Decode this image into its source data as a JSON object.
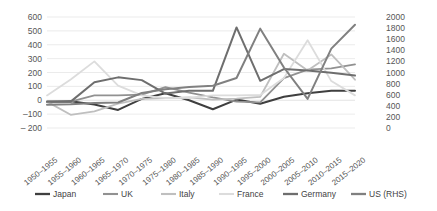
{
  "chart_data": {
    "type": "line",
    "title": "",
    "subtitle": "",
    "xlabel": "",
    "ylabel": "",
    "grid": true,
    "legend_position": "bottom",
    "categories": [
      "1950–1955",
      "1955–1960",
      "1960–1965",
      "1965–1970",
      "1970–1975",
      "1975–1980",
      "1980–1985",
      "1985–1990",
      "1990–1995",
      "1995–2000",
      "2000–2005",
      "2005–2010",
      "2010–2015",
      "2015–2020"
    ],
    "left_axis": {
      "label": "",
      "ylim": [
        -200,
        600
      ],
      "tick_step": 100,
      "ticks": [
        "600",
        "500",
        "400",
        "300",
        "200",
        "100",
        "0",
        "–100",
        "– 200"
      ],
      "tick_values": [
        600,
        500,
        400,
        300,
        200,
        100,
        0,
        -100,
        -200
      ]
    },
    "right_axis": {
      "label": "",
      "ylim": [
        0,
        2000
      ],
      "tick_step": 200,
      "ticks": [
        "2000",
        "1800",
        "1600",
        "1400",
        "1200",
        "1000",
        "800",
        "600",
        "400",
        "200",
        "0"
      ],
      "tick_values": [
        2000,
        1800,
        1600,
        1400,
        1200,
        1000,
        800,
        600,
        400,
        200,
        0
      ]
    },
    "series": [
      {
        "name": "Japan",
        "axis": "left",
        "color": "#3f3f3f",
        "width": 2.0,
        "values": [
          -10,
          -8,
          -30,
          -70,
          10,
          50,
          0,
          -65,
          5,
          -25,
          25,
          50,
          68,
          68
        ]
      },
      {
        "name": "UK",
        "axis": "left",
        "color": "#919191",
        "width": 1.8,
        "values": [
          -8,
          -10,
          35,
          35,
          40,
          95,
          55,
          20,
          -10,
          -15,
          160,
          220,
          230,
          258
        ]
      },
      {
        "name": "Italy",
        "axis": "left",
        "color": "#bfbfbf",
        "width": 1.8,
        "values": [
          -10,
          -105,
          -80,
          -25,
          10,
          15,
          20,
          5,
          12,
          25,
          335,
          215,
          330,
          148
        ]
      },
      {
        "name": "France",
        "axis": "left",
        "color": "#dcdcdc",
        "width": 1.8,
        "values": [
          35,
          150,
          280,
          105,
          35,
          15,
          18,
          35,
          35,
          38,
          160,
          432,
          138,
          35
        ]
      },
      {
        "name": "Germany",
        "axis": "left",
        "color": "#6e6e6e",
        "width": 2.0,
        "values": [
          -10,
          -10,
          130,
          165,
          145,
          48,
          68,
          68,
          525,
          140,
          225,
          215,
          198,
          178
        ]
      },
      {
        "name": "US (RHS)",
        "axis": "right",
        "color": "#808080",
        "width": 2.0,
        "values": [
          420,
          430,
          450,
          460,
          630,
          700,
          740,
          760,
          900,
          1790,
          1090,
          525,
          1430,
          1860
        ]
      }
    ]
  },
  "legend": {
    "items": [
      {
        "label": "Japan"
      },
      {
        "label": "UK"
      },
      {
        "label": "Italy"
      },
      {
        "label": "France"
      },
      {
        "label": "Germany"
      },
      {
        "label": "US (RHS)"
      }
    ]
  }
}
